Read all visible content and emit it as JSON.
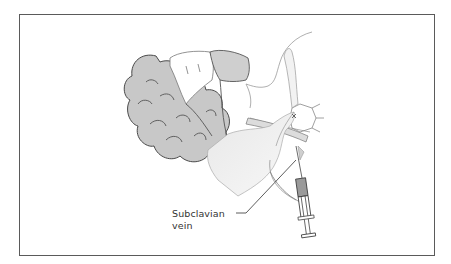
{
  "figure": {
    "labels": [
      {
        "id": "subclavian-vein",
        "line1": "Subclavian",
        "line2": "vein"
      }
    ],
    "colors": {
      "frame": "#5a5a5a",
      "hair": "#c9c9c9",
      "skin_shade": "#e6e6e6",
      "outline": "#555555",
      "syringe_fill": "#9a9a9a",
      "background": "#ffffff"
    }
  }
}
